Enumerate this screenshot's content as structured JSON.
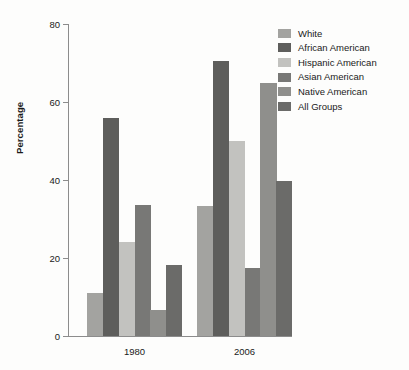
{
  "chart_data": {
    "type": "bar",
    "title": "",
    "subtitle": "",
    "xlabel": "",
    "ylabel": "Percentage",
    "categories": [
      "1980",
      "2006"
    ],
    "ylim": [
      0,
      80
    ],
    "yticks": [
      0,
      20,
      40,
      60,
      80
    ],
    "ytick_labels": [
      "0",
      "20",
      "40",
      "60",
      "80"
    ],
    "grid": false,
    "legend_position": "top-right",
    "series": [
      {
        "name": "White",
        "color": "#a3a3a0",
        "values": [
          11.0,
          33.3
        ]
      },
      {
        "name": "African American",
        "color": "#5e5e5c",
        "values": [
          56.0,
          70.5
        ]
      },
      {
        "name": "Hispanic American",
        "color": "#c2c2bf",
        "values": [
          24.0,
          50.0
        ]
      },
      {
        "name": "Asian American",
        "color": "#787876",
        "values": [
          33.5,
          17.5
        ]
      },
      {
        "name": "Native American",
        "color": "#8f8f8c",
        "values": [
          6.7,
          65.0
        ]
      },
      {
        "name": "All Groups",
        "color": "#6b6b69",
        "values": [
          18.3,
          39.7
        ]
      }
    ]
  },
  "legend": {
    "items": [
      {
        "label": "White"
      },
      {
        "label": "African American"
      },
      {
        "label": "Hispanic American"
      },
      {
        "label": "Asian American"
      },
      {
        "label": "Native American"
      },
      {
        "label": "All Groups"
      }
    ]
  },
  "axis": {
    "y_title": "Percentage",
    "y_ticks": [
      "80",
      "60",
      "40",
      "20",
      "0"
    ],
    "x_labels": [
      "1980",
      "2006"
    ]
  }
}
